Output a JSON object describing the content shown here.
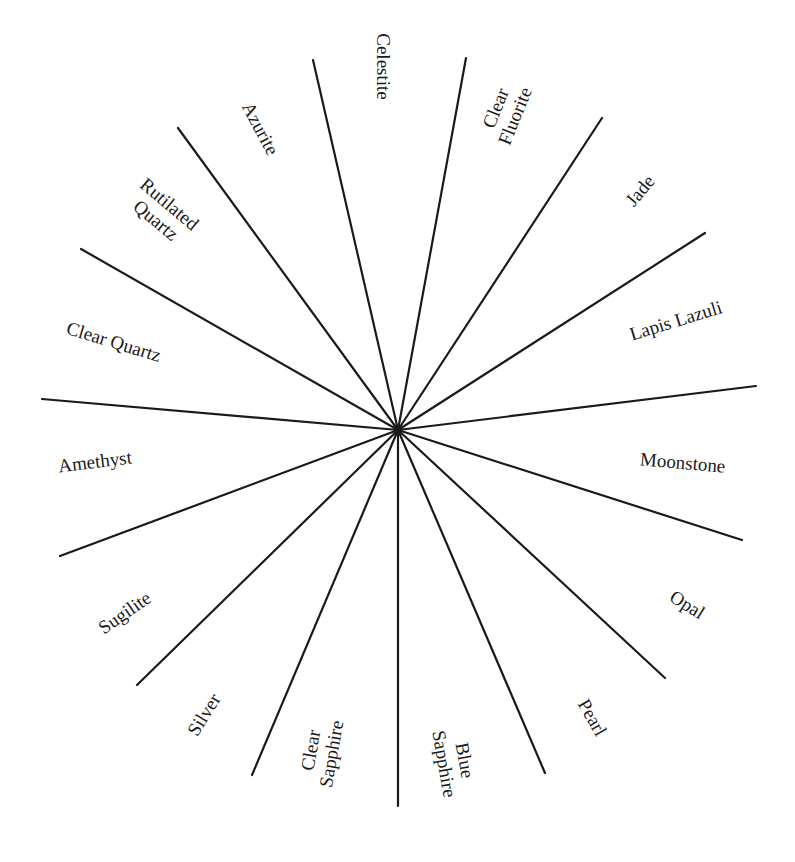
{
  "diagram": {
    "type": "radial-wheel",
    "center": {
      "x": 398,
      "y": 430
    },
    "line_color": "#1a1a1a",
    "background": "#ffffff",
    "spokes": [
      {
        "x2": 313,
        "y2": 60
      },
      {
        "x2": 466,
        "y2": 58
      },
      {
        "x2": 602,
        "y2": 118
      },
      {
        "x2": 705,
        "y2": 233
      },
      {
        "x2": 756,
        "y2": 386
      },
      {
        "x2": 742,
        "y2": 540
      },
      {
        "x2": 665,
        "y2": 678
      },
      {
        "x2": 545,
        "y2": 773
      },
      {
        "x2": 398,
        "y2": 806
      },
      {
        "x2": 252,
        "y2": 775
      },
      {
        "x2": 137,
        "y2": 685
      },
      {
        "x2": 60,
        "y2": 556
      },
      {
        "x2": 42,
        "y2": 399
      },
      {
        "x2": 81,
        "y2": 249
      },
      {
        "x2": 178,
        "y2": 128
      }
    ],
    "labels": [
      {
        "id": "celestite",
        "lines": [
          "Celestite"
        ],
        "cx": 383,
        "cy": 66,
        "rotate": 90
      },
      {
        "id": "clear-fluorite",
        "lines": [
          "Clear",
          "Fluorite"
        ],
        "cx": 505,
        "cy": 112,
        "rotate": -68
      },
      {
        "id": "jade",
        "lines": [
          "Jade"
        ],
        "cx": 640,
        "cy": 190,
        "rotate": -50
      },
      {
        "id": "lapis-lazuli",
        "lines": [
          "Lapis Lazuli"
        ],
        "cx": 676,
        "cy": 320,
        "rotate": -17
      },
      {
        "id": "moonstone",
        "lines": [
          "Moonstone"
        ],
        "cx": 683,
        "cy": 462,
        "rotate": 5
      },
      {
        "id": "opal",
        "lines": [
          "Opal"
        ],
        "cx": 687,
        "cy": 604,
        "rotate": 32
      },
      {
        "id": "pearl",
        "lines": [
          "Pearl"
        ],
        "cx": 592,
        "cy": 717,
        "rotate": 60
      },
      {
        "id": "blue-sapphire",
        "lines": [
          "Blue",
          "Sapphire"
        ],
        "cx": 455,
        "cy": 762,
        "rotate": 80
      },
      {
        "id": "clear-sapphire",
        "lines": [
          "Clear",
          "Sapphire"
        ],
        "cx": 321,
        "cy": 752,
        "rotate": -80
      },
      {
        "id": "silver",
        "lines": [
          "Silver"
        ],
        "cx": 203,
        "cy": 714,
        "rotate": -58
      },
      {
        "id": "sugilite",
        "lines": [
          "Sugilite"
        ],
        "cx": 124,
        "cy": 612,
        "rotate": -35
      },
      {
        "id": "amethyst",
        "lines": [
          "Amethyst"
        ],
        "cx": 95,
        "cy": 461,
        "rotate": -7
      },
      {
        "id": "clear-quartz",
        "lines": [
          "Clear Quartz"
        ],
        "cx": 114,
        "cy": 341,
        "rotate": 17
      },
      {
        "id": "rutilated-quartz",
        "lines": [
          "Rutilated",
          "Quartz"
        ],
        "cx": 163,
        "cy": 212,
        "rotate": 40
      },
      {
        "id": "azurite",
        "lines": [
          "Azurite"
        ],
        "cx": 260,
        "cy": 128,
        "rotate": 62
      }
    ]
  }
}
